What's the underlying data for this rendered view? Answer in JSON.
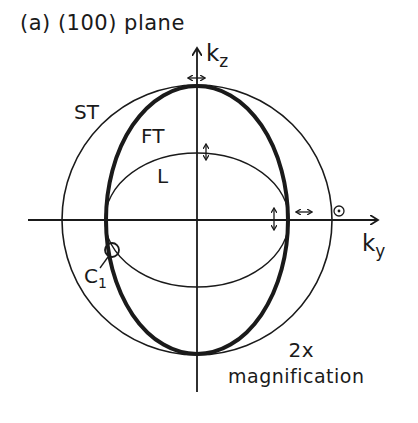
{
  "title": "(a) (100) plane",
  "axes": {
    "vertical_label": "k",
    "vertical_sub": "z",
    "horizontal_label": "k",
    "horizontal_sub": "y"
  },
  "curves": [
    {
      "label": "ST",
      "shape": "circle",
      "stroke": "thin"
    },
    {
      "label": "FT",
      "shape": "ellipse-tall",
      "stroke": "thick"
    },
    {
      "label": "L",
      "shape": "ellipse-wide",
      "stroke": "thin"
    }
  ],
  "labels": {
    "st": "ST",
    "ft": "FT",
    "l": "L",
    "c1": "C",
    "c1_sub": "1"
  },
  "polarization_symbols": [
    "vertical-double-arrow",
    "horizontal-double-arrow",
    "out-of-plane-dot"
  ],
  "annotation": {
    "line1": "2x",
    "line2": "magnification"
  },
  "colors": {
    "ink": "#1a1a1a",
    "background": "#ffffff"
  }
}
